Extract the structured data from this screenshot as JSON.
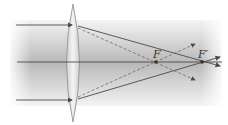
{
  "diagram": {
    "labels": {
      "focus": "F",
      "focus_prime": "F′"
    },
    "colors": {
      "ray": "#4a4a4a",
      "dashed_ray": "#6a6a6a",
      "beam_dark": "#bdbdbd",
      "beam_light": "#f2f2f2",
      "lens_fill": "#e6e6e6",
      "lens_edge": "#8a8a8a"
    },
    "elements": [
      "incident parallel ray (top)",
      "incident parallel ray (bottom)",
      "principal axis",
      "convex lens",
      "solid refracted rays to F′",
      "dashed rays to F",
      "focal point F",
      "focal point F′"
    ]
  }
}
